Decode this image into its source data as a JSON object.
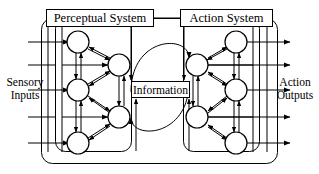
{
  "diagram": {
    "title_boxes": {
      "perceptual_system": "Perceptual System",
      "action_system": "Action System",
      "information": "Information"
    },
    "side_labels": {
      "sensory_inputs_line1": "Sensory",
      "sensory_inputs_line2": "Inputs",
      "action_outputs_line1": "Action",
      "action_outputs_line2": "Outputs"
    },
    "colors": {
      "stroke": "#000000",
      "background": "#ffffff",
      "node_fill": "#ffffff"
    },
    "structure": {
      "left_system_nodes": 5,
      "right_system_nodes": 5,
      "sensory_input_lines": 5,
      "action_output_lines": 5,
      "interconnect_arcs": 2
    }
  }
}
